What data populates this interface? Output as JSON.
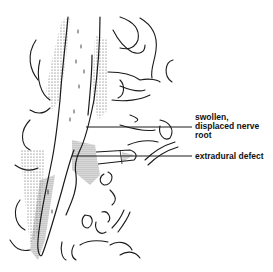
{
  "figure": {
    "stroke_color": "#1a1a1a",
    "stipple_color": "#333333",
    "background": "#ffffff"
  },
  "labels": {
    "nerve_root": "swollen,\ndisplaced nerve\nroot",
    "extradural_defect": "extradural defect"
  }
}
